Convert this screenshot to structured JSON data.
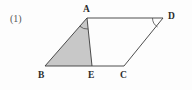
{
  "figure": {
    "index_label": "(1)",
    "shape_name": "parallelogram-abcd",
    "background_color": "#fdfdfd",
    "stroke_color": "#3a3a3a",
    "shaded_fill_color": "#c8c8c8",
    "vertices": [
      {
        "name": "A",
        "label": "A",
        "x": 87,
        "y": 18
      },
      {
        "name": "D",
        "label": "D",
        "x": 163,
        "y": 18
      },
      {
        "name": "B",
        "label": "B",
        "x": 45,
        "y": 66
      },
      {
        "name": "E",
        "label": "E",
        "x": 92,
        "y": 66
      },
      {
        "name": "C",
        "label": "C",
        "x": 124,
        "y": 66
      }
    ],
    "edges": [
      {
        "name": "edge-AD",
        "from": "A",
        "to": "D"
      },
      {
        "name": "edge-AB",
        "from": "A",
        "to": "B"
      },
      {
        "name": "edge-BC",
        "from": "B",
        "to": "C"
      },
      {
        "name": "edge-DC",
        "from": "D",
        "to": "C"
      },
      {
        "name": "segment-AE",
        "from": "A",
        "to": "E"
      }
    ],
    "shaded_region": {
      "name": "triangle-ABE",
      "points": "87,18 45,66 92,66"
    },
    "angle_marks": [
      {
        "name": "angle-mark-A",
        "vertex": "A",
        "between": "AB and AE"
      },
      {
        "name": "angle-mark-D",
        "vertex": "D",
        "between": "DA and DC"
      }
    ]
  }
}
